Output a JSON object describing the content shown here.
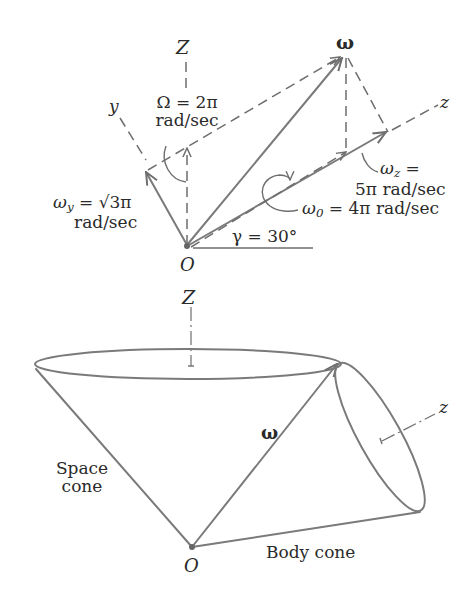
{
  "top_diagram": {
    "axis_Z": "Z",
    "axis_y": "y",
    "axis_z": "z",
    "origin": "O",
    "omega_vector": "ω",
    "Omega_label_line1": "Ω = 2π",
    "Omega_label_line2": "rad/sec",
    "omega_y_symbol": "ω",
    "omega_y_sub": "y",
    "omega_y_value": " = √3π",
    "omega_y_unit": "rad/sec",
    "omega_z_symbol": "ω",
    "omega_z_sub": "z",
    "omega_z_eq": " =",
    "omega_z_value": "5π rad/sec",
    "omega_0_symbol": "ω",
    "omega_0_sub": "0",
    "omega_0_value": " = 4π rad/sec",
    "gamma_label": "γ = 30°"
  },
  "bottom_diagram": {
    "axis_Z": "Z",
    "axis_z": "z",
    "omega_vector": "ω",
    "origin": "O",
    "space_cone_line1": "Space",
    "space_cone_line2": "cone",
    "body_cone": "Body cone"
  },
  "colors": {
    "line": "#7a7a7a",
    "text": "#2a2a2a",
    "background": "#ffffff"
  }
}
